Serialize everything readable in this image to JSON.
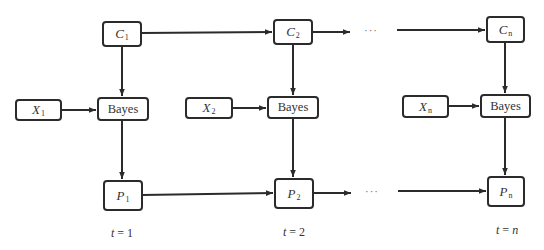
{
  "diagram": {
    "type": "flowchart",
    "columns": [
      {
        "id": "t1",
        "c": {
          "symbol": "C",
          "sub": "1"
        },
        "x": {
          "symbol": "X",
          "sub": "1"
        },
        "bayes": "Bayes",
        "p": {
          "symbol": "P",
          "sub": "1"
        },
        "time": {
          "var": "t",
          "eq": " = 1"
        }
      },
      {
        "id": "t2",
        "c": {
          "symbol": "C",
          "sub": "2"
        },
        "x": {
          "symbol": "X",
          "sub": "2"
        },
        "bayes": "Bayes",
        "p": {
          "symbol": "P",
          "sub": "2"
        },
        "time": {
          "var": "t",
          "eq": " = 2"
        }
      },
      {
        "id": "tn",
        "c": {
          "symbol": "C",
          "sub": "n"
        },
        "x": {
          "symbol": "X",
          "sub": "n"
        },
        "bayes": "Bayes",
        "p": {
          "symbol": "P",
          "sub": "n"
        },
        "time": {
          "var": "t",
          "eq": " = ",
          "val": "n"
        }
      }
    ],
    "ellipsis": "···",
    "edges": [
      [
        "C1",
        "C2"
      ],
      [
        "C2",
        "…"
      ],
      [
        "…",
        "Cn"
      ],
      [
        "C1",
        "Bayes1"
      ],
      [
        "X1",
        "Bayes1"
      ],
      [
        "Bayes1",
        "P1"
      ],
      [
        "C2",
        "Bayes2"
      ],
      [
        "X2",
        "Bayes2"
      ],
      [
        "Bayes2",
        "P2"
      ],
      [
        "Cn",
        "Bayesn"
      ],
      [
        "Xn",
        "Bayesn"
      ],
      [
        "Bayesn",
        "Pn"
      ],
      [
        "P1",
        "P2"
      ],
      [
        "P2",
        "…"
      ],
      [
        "…",
        "Pn"
      ]
    ],
    "colors": {
      "stroke": "#2b2b2b",
      "text": "#333333",
      "background": "#ffffff"
    }
  }
}
